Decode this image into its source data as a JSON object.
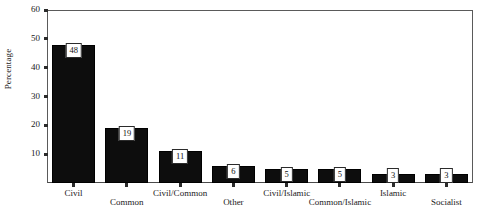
{
  "chart_data": {
    "type": "bar",
    "title": "",
    "xlabel": "",
    "ylabel": "Percentage",
    "ylim": [
      0,
      60
    ],
    "ytick_values": [
      0,
      10,
      20,
      30,
      40,
      50,
      60
    ],
    "ytick_labels": [
      "",
      "10",
      "20",
      "30",
      "40",
      "50",
      "60"
    ],
    "grid": false,
    "legend": "none",
    "bar_color": "#0d0d0d",
    "categories": [
      "Civil",
      "Common",
      "Civil/Common",
      "Other",
      "Civil/Islamic",
      "Common/Islamic",
      "Islamic",
      "Socialist"
    ],
    "values": [
      48,
      19,
      11,
      6,
      5,
      5,
      3,
      3
    ],
    "data_labels": [
      "48",
      "19",
      "11",
      "6",
      "5",
      "5",
      "3",
      "3"
    ],
    "label_rows": [
      "top",
      "bottom",
      "top",
      "bottom",
      "top",
      "bottom",
      "top",
      "bottom"
    ]
  },
  "axis": {
    "y_title": "Percentage"
  }
}
